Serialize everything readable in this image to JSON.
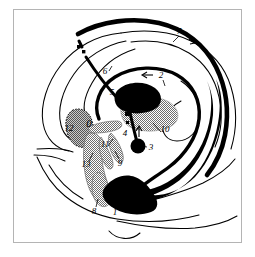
{
  "figure": {
    "frame_border_color": "#b4b4b4",
    "background_color": "#ffffff",
    "ink_color": "#000000",
    "stipple_color": "#8a8a8a"
  },
  "labels": [
    {
      "id": "label-0",
      "text": "0",
      "x": 76,
      "y": 118,
      "leader": false,
      "arrow": null
    },
    {
      "id": "label-1",
      "text": "1",
      "x": 102,
      "y": 203,
      "leader": true,
      "arrow": null
    },
    {
      "id": "label-2",
      "text": "2",
      "x": 146,
      "y": 68,
      "leader": true,
      "arrow": "left"
    },
    {
      "id": "label-3",
      "text": "3",
      "x": 136,
      "y": 140,
      "leader": true,
      "arrow": null
    },
    {
      "id": "label-4",
      "text": "4",
      "x": 113,
      "y": 124,
      "leader": true,
      "arrow": "up"
    },
    {
      "id": "label-5",
      "text": "5",
      "x": 99,
      "y": 88,
      "leader": true,
      "arrow": null
    },
    {
      "id": "label-6",
      "text": "6",
      "x": 92,
      "y": 65,
      "leader": true,
      "arrow": null
    },
    {
      "id": "label-7",
      "text": "7",
      "x": 164,
      "y": 24,
      "leader": true,
      "arrow": "right"
    },
    {
      "id": "label-8",
      "text": "8",
      "x": 81,
      "y": 201,
      "leader": true,
      "arrow": null
    },
    {
      "id": "label-9",
      "text": "9",
      "x": 106,
      "y": 153,
      "leader": true,
      "arrow": null
    },
    {
      "id": "label-10",
      "text": "10",
      "x": 149,
      "y": 126,
      "leader": true,
      "arrow": null
    },
    {
      "id": "label-11",
      "text": "11",
      "x": 91,
      "y": 140,
      "leader": true,
      "arrow": null
    },
    {
      "id": "label-12",
      "text": "12",
      "x": 58,
      "y": 120,
      "leader": false,
      "arrow": null
    },
    {
      "id": "label-13",
      "text": "13",
      "x": 74,
      "y": 155,
      "leader": true,
      "arrow": null
    }
  ]
}
